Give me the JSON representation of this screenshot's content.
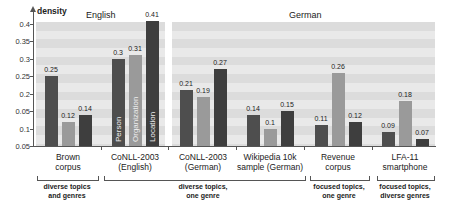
{
  "chart_data": {
    "type": "bar",
    "title": "",
    "ylabel": "density",
    "xlabel": "",
    "ylim": [
      0.05,
      0.4
    ],
    "y_ticks": [
      "0.4",
      "0.35",
      "0.3",
      "0.25",
      "0.2",
      "0.05",
      "0.1",
      "0.05"
    ],
    "panels": [
      {
        "label": "English",
        "categories": [
          "Brown corpus",
          "CoNLL-2003 (English)"
        ]
      },
      {
        "label": "German",
        "categories": [
          "CoNLL-2003 (German)",
          "Wikipedia 10k sample (German)",
          "Revenue corpus",
          "LFA-11 smartphone"
        ]
      }
    ],
    "categories": [
      "Brown corpus",
      "CoNLL-2003 (English)",
      "CoNLL-2003 (German)",
      "Wikipedia 10k sample (German)",
      "Revenue corpus",
      "LFA-11 smartphone"
    ],
    "series": [
      {
        "name": "Person",
        "values": [
          0.25,
          0.3,
          0.21,
          0.14,
          0.11,
          0.09
        ]
      },
      {
        "name": "Organization",
        "values": [
          0.12,
          0.31,
          0.19,
          0.1,
          0.26,
          0.18
        ]
      },
      {
        "name": "Location",
        "values": [
          0.14,
          0.41,
          0.27,
          0.15,
          0.12,
          0.07
        ]
      }
    ],
    "value_labels": [
      [
        "0.25",
        "0.12",
        "0.14"
      ],
      [
        "0.3",
        "0.31",
        "0.41"
      ],
      [
        "0.21",
        "0.19",
        "0.27"
      ],
      [
        "0.14",
        "0.1",
        "0.15"
      ],
      [
        "0.11",
        "0.26",
        "0.12"
      ],
      [
        "0.09",
        "0.18",
        "0.07"
      ]
    ],
    "in_bar_labels": [
      "Person",
      "Organization",
      "Location"
    ],
    "category_groups": [
      {
        "label": "diverse topics and genres",
        "categories": [
          "Brown corpus"
        ]
      },
      {
        "label": "diverse topics, one genre",
        "categories": [
          "CoNLL-2003 (English)",
          "CoNLL-2003 (German)",
          "Wikipedia 10k sample (German)"
        ]
      },
      {
        "label": "focused topics, one genre",
        "categories": [
          "Revenue corpus"
        ]
      },
      {
        "label": "focused topics, diverse genres",
        "categories": [
          "LFA-11 smartphone"
        ]
      }
    ],
    "colors": {
      "Person": "#4e4e4e",
      "Organization": "#9a9a9a",
      "Location": "#3e3e3e"
    },
    "legend_position": "in-bar labels",
    "grid": "alternating bands"
  },
  "axis": {
    "ylabel": "density"
  },
  "panels": {
    "english": "English",
    "german": "German"
  },
  "cats": [
    {
      "l1": "Brown",
      "l2": "corpus"
    },
    {
      "l1": "CoNLL-2003",
      "l2": "(English)"
    },
    {
      "l1": "CoNLL-2003",
      "l2": "(German)"
    },
    {
      "l1": "Wikipedia 10k",
      "l2": "sample (German)"
    },
    {
      "l1": "Revenue",
      "l2": "corpus"
    },
    {
      "l1": "LFA-11",
      "l2": "smartphone"
    }
  ],
  "groups": [
    {
      "l1": "diverse topics",
      "l2": "and genres"
    },
    {
      "l1": "diverse topics,",
      "l2": "one genre"
    },
    {
      "l1": "focused topics,",
      "l2": "one genre"
    },
    {
      "l1": "focused topics,",
      "l2": "diverse genres"
    }
  ]
}
